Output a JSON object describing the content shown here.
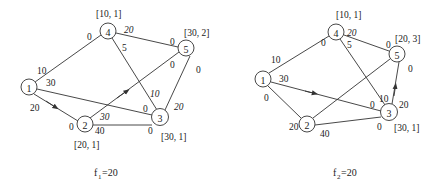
{
  "graphs": [
    {
      "id": "f1",
      "caption": {
        "prefix": "f",
        "sub": "1",
        "suffix": "=20"
      },
      "nodes": [
        {
          "id": "1",
          "label": "1",
          "x": 29,
          "y": 87,
          "tag": ""
        },
        {
          "id": "2",
          "label": "2",
          "x": 85,
          "y": 124,
          "tag": "[20, 1]"
        },
        {
          "id": "3",
          "label": "3",
          "x": 160,
          "y": 117,
          "tag": "[30, 1]"
        },
        {
          "id": "4",
          "label": "4",
          "x": 108,
          "y": 31,
          "tag": "[10, 1]"
        },
        {
          "id": "5",
          "label": "5",
          "x": 186,
          "y": 48,
          "tag": "[30, 2]"
        }
      ],
      "edges": [
        {
          "from": "1",
          "to": "4",
          "labels": [
            "10",
            "0"
          ]
        },
        {
          "from": "1",
          "to": "3",
          "labels": [
            "30",
            "0"
          ]
        },
        {
          "from": "1",
          "to": "2",
          "labels": [
            "20",
            "0"
          ],
          "arrow": true
        },
        {
          "from": "2",
          "to": "5",
          "labels": [
            "30",
            "0"
          ],
          "arrow": true
        },
        {
          "from": "2",
          "to": "3",
          "labels": [
            "40",
            "0"
          ]
        },
        {
          "from": "4",
          "to": "5",
          "labels": [
            "20",
            "0"
          ]
        },
        {
          "from": "4",
          "to": "3",
          "labels": [
            "5",
            "10"
          ]
        },
        {
          "from": "3",
          "to": "5",
          "labels": [
            "20",
            "0"
          ]
        }
      ]
    },
    {
      "id": "f2",
      "caption": {
        "prefix": "f",
        "sub": "2",
        "suffix": "=20"
      },
      "nodes": [
        {
          "id": "1",
          "label": "1",
          "x": 263,
          "y": 79,
          "tag": ""
        },
        {
          "id": "2",
          "label": "2",
          "x": 307,
          "y": 124,
          "tag": ""
        },
        {
          "id": "3",
          "label": "3",
          "x": 389,
          "y": 112,
          "tag": "[30, 1]"
        },
        {
          "id": "4",
          "label": "4",
          "x": 336,
          "y": 32,
          "tag": "[10, 1]"
        },
        {
          "id": "5",
          "label": "5",
          "x": 397,
          "y": 54,
          "tag": "[20, 3]"
        }
      ],
      "edges": [
        {
          "from": "1",
          "to": "4",
          "labels": [
            "10",
            "0"
          ]
        },
        {
          "from": "1",
          "to": "3",
          "labels": [
            "30",
            "0"
          ],
          "arrow": true
        },
        {
          "from": "1",
          "to": "2",
          "labels": [
            "0",
            "20"
          ]
        },
        {
          "from": "2",
          "to": "5",
          "labels": [
            "",
            ""
          ]
        },
        {
          "from": "2",
          "to": "3",
          "labels": [
            "40",
            "0"
          ]
        },
        {
          "from": "4",
          "to": "5",
          "labels": [
            "20",
            "0"
          ]
        },
        {
          "from": "4",
          "to": "3",
          "labels": [
            "5",
            "10"
          ]
        },
        {
          "from": "3",
          "to": "5",
          "labels": [
            "20",
            "0"
          ],
          "arrow": true
        }
      ]
    }
  ],
  "text": {
    "g1_n1": "1",
    "g1_n2": "2",
    "g1_n3": "3",
    "g1_n4": "4",
    "g1_n5": "5",
    "g1_tag2": "[20, 1]",
    "g1_tag3": "[30, 1]",
    "g1_tag4": "[10, 1]",
    "g1_tag5": "[30, 2]",
    "g1_e14a": "10",
    "g1_e14b": "0",
    "g1_e13a": "30",
    "g1_e13b": "0",
    "g1_e12a": "20",
    "g1_e12b": "0",
    "g1_e25a": "30",
    "g1_e25b": "0",
    "g1_e23a": "40",
    "g1_e23b": "0",
    "g1_e45a": "20",
    "g1_e45b": "0",
    "g1_e43a": "5",
    "g1_e43b": "10",
    "g1_e35a": "20",
    "g1_e35b": "0",
    "g1_cap_f": "f",
    "g1_cap_sub": "1",
    "g1_cap_val": "=20",
    "g2_n1": "1",
    "g2_n2": "2",
    "g2_n3": "3",
    "g2_n4": "4",
    "g2_n5": "5",
    "g2_tag3": "[30, 1]",
    "g2_tag4": "[10, 1]",
    "g2_tag5": "[20, 3]",
    "g2_e14a": "10",
    "g2_e14b": "0",
    "g2_e13a": "30",
    "g2_e13b": "0",
    "g2_e12a": "0",
    "g2_e12b": "20",
    "g2_e23a": "40",
    "g2_e23b": "0",
    "g2_e45a": "20",
    "g2_e45b": "0",
    "g2_e43a": "5",
    "g2_e43b": "10",
    "g2_e35a": "20",
    "g2_e35b": "0",
    "g2_cap_f": "f",
    "g2_cap_sub": "2",
    "g2_cap_val": "=20"
  }
}
